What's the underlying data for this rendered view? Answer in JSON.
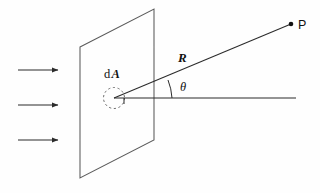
{
  "figure": {
    "background_color": "#fefefe",
    "stroke_color": "#2b2b2b",
    "text_color": "#111111",
    "labels": {
      "area_element": "dA",
      "area_element_prefix": "d",
      "area_element_symbol": "A",
      "distance": "R",
      "angle": "θ",
      "point": "P"
    },
    "elements": {
      "plane_name": "surface-plane",
      "dashed_circle_name": "area-element-circle",
      "ray_name": "ray-to-point-p",
      "normal_name": "surface-normal-axis",
      "arc_name": "angle-arc",
      "point_marker_name": "point-p-marker",
      "incident_arrows_name": "incident-radiation-arrows"
    },
    "geometry": {
      "plane_points": "80,47 154,9 154,140 80,178",
      "vertex_x": 114,
      "vertex_y": 98,
      "point_p_x": 291,
      "point_p_y": 24,
      "normal_end_x": 296,
      "normal_end_y": 98,
      "circle_cx": 114,
      "circle_cy": 98,
      "circle_r": 10.5,
      "arc_path": "M 172 98 A 58 58 0 0 0 168 80",
      "tick_x": 124,
      "tick_y_top": 98,
      "tick_y_bottom": 104
    },
    "incident_arrows": [
      {
        "id": "arrow-1",
        "x1": 18,
        "y1": 70,
        "x2": 58,
        "y2": 70
      },
      {
        "id": "arrow-2",
        "x1": 18,
        "y1": 105,
        "x2": 58,
        "y2": 105
      },
      {
        "id": "arrow-3",
        "x1": 18,
        "y1": 140,
        "x2": 58,
        "y2": 140
      }
    ],
    "label_positions": {
      "dA_x": 104,
      "dA_y": 78,
      "R_x": 178,
      "R_y": 62,
      "theta_x": 180,
      "theta_y": 91,
      "P_x": 298,
      "P_y": 29
    }
  }
}
